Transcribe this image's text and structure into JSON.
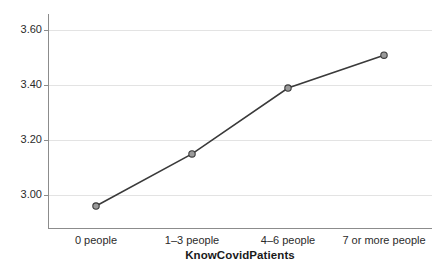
{
  "chart_data": {
    "type": "line",
    "title": "",
    "subtitle": "",
    "xlabel": "KnowCovidPatients",
    "ylabel": "Mean of realistic2",
    "categories": [
      "0 people",
      "1–3 people",
      "4–6 people",
      "7 or more people"
    ],
    "values": [
      2.96,
      3.15,
      3.39,
      3.51
    ],
    "series": [
      {
        "name": "Mean of realistic2",
        "values": [
          2.96,
          3.15,
          3.39,
          3.51
        ]
      }
    ],
    "ylim": [
      2.88,
      3.66
    ],
    "yticks": [
      "3.00",
      "3.20",
      "3.40",
      "3.60"
    ],
    "ytick_values": [
      3.0,
      3.2,
      3.4,
      3.6
    ],
    "grid": "horizontal",
    "legend": "none",
    "marker": "circle",
    "marker_fill": "#9a9a9a",
    "line_color": "#3a3a3a",
    "grid_color": "#e3e3e3",
    "axis_color": "#8c8c8c",
    "background": "#ffffff"
  },
  "axes": {
    "y_title": "Mean of realistic2",
    "x_title": "KnowCovidPatients",
    "y_ticks": [
      {
        "label": "3.60"
      },
      {
        "label": "3.40"
      },
      {
        "label": "3.20"
      },
      {
        "label": "3.00"
      }
    ],
    "x_ticks": [
      {
        "label": "0 people"
      },
      {
        "label": "1–3 people"
      },
      {
        "label": "4–6 people"
      },
      {
        "label": "7 or more people"
      }
    ]
  }
}
